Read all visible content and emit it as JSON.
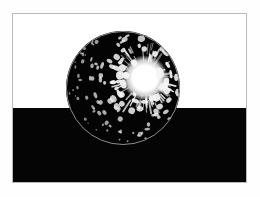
{
  "image": {
    "title": "Sphere with specular highlight over split horizon",
    "canvas": {
      "width": 260,
      "height": 197,
      "background_color": "#fefefe"
    },
    "frame": {
      "border_color": "#b9b9b9",
      "border_width_px": 1,
      "x": 12,
      "y": 13,
      "width": 235,
      "height": 170
    },
    "bands": [
      {
        "name": "sky",
        "color": "#ffffff",
        "from_y": 13,
        "to_y": 108,
        "label": "upper white field"
      },
      {
        "name": "ground",
        "color": "#050505",
        "from_y": 108,
        "to_y": 183,
        "label": "lower black field"
      }
    ],
    "horizon": {
      "y": 108,
      "relative_percent": 55.9
    },
    "sphere": {
      "name": "rendered-sphere",
      "center_x": 123,
      "center_y": 88,
      "radius": 57,
      "body_color": "#040404",
      "rim_color": "#8d8d8d",
      "rim_width_px": 1
    },
    "highlight": {
      "name": "specular-highlight",
      "center_x": 145,
      "center_y": 78,
      "core_radius": 17,
      "core_color": "#ffffff",
      "falloff_radius": 34,
      "speckle_color": "#f5f5f5",
      "speckle_count": 260,
      "speckle_min_size": 0.6,
      "speckle_max_size": 3.4,
      "seed": 20240917
    },
    "caption": ""
  }
}
